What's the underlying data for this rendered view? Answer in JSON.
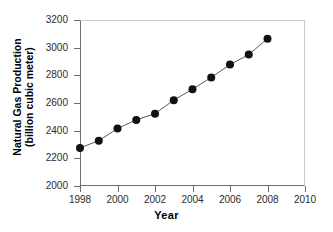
{
  "chart_data": {
    "type": "line",
    "title": "",
    "xlabel": "Year",
    "ylabel_line1": "Natural Gas Production",
    "ylabel_line2": "(billion cubic meter)",
    "ylabel": "Natural Gas Production (billion cubic meter)",
    "x": [
      1998,
      1999,
      2000,
      2001,
      2002,
      2003,
      2004,
      2005,
      2006,
      2007,
      2008
    ],
    "values": [
      2275,
      2328,
      2415,
      2478,
      2523,
      2620,
      2700,
      2785,
      2878,
      2950,
      3065
    ],
    "series": [
      {
        "name": "Natural Gas Production",
        "values": [
          2275,
          2328,
          2415,
          2478,
          2523,
          2620,
          2700,
          2785,
          2878,
          2950,
          3065
        ]
      }
    ],
    "xlim": [
      1998,
      2010
    ],
    "ylim": [
      2000,
      3200
    ],
    "xticks": [
      "1998",
      "2000",
      "2002",
      "2004",
      "2006",
      "2008",
      "2010"
    ],
    "yticks": [
      "2000",
      "2200",
      "2400",
      "2600",
      "2800",
      "3000",
      "3200"
    ],
    "grid": false,
    "legend": false,
    "marker": "filled-circle",
    "marker_color": "#111111",
    "line_color": "#5a5a5a",
    "axis_color": "#6e6e6e",
    "background": "#ffffff"
  }
}
